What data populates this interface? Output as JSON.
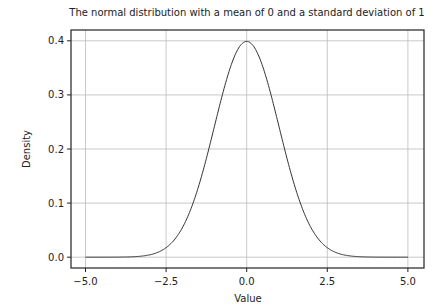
{
  "chart_data": {
    "type": "line",
    "title": "The normal distribution with a mean of 0 and a standard deviation of 1",
    "xlabel": "Value",
    "ylabel": "Density",
    "xlim": [
      -5.45,
      5.5
    ],
    "ylim": [
      -0.02,
      0.42
    ],
    "xticks": [
      -5.0,
      -2.5,
      0.0,
      2.5,
      5.0
    ],
    "xtick_labels": [
      "−5.0",
      "−2.5",
      "0.0",
      "2.5",
      "5.0"
    ],
    "yticks": [
      0.0,
      0.1,
      0.2,
      0.3,
      0.4
    ],
    "ytick_labels": [
      "0.0",
      "0.1",
      "0.2",
      "0.3",
      "0.4"
    ],
    "grid": true,
    "legend": "none",
    "series": [
      {
        "name": "normal pdf (mean 0, sd 1)",
        "mean": 0,
        "std": 1,
        "x_range": [
          -5,
          5
        ],
        "color": "#333333"
      }
    ]
  }
}
